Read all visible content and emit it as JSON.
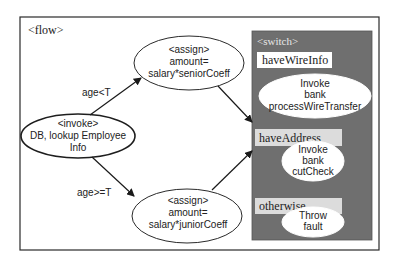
{
  "flow": {
    "label": "<flow>",
    "invoke_node": {
      "line1": "<invoke>",
      "line2": "DB, lookup Employee",
      "line3": "Info"
    },
    "senior_assign": {
      "line1": "<assign>",
      "line2": "amount=",
      "line3": "salary*seniorCoeff"
    },
    "junior_assign": {
      "line1": "<assign>",
      "line2": "amount=",
      "line3": "salary*juniorCoeff"
    },
    "edges": {
      "senior_condition": "age<T",
      "junior_condition": "age>=T"
    }
  },
  "switch": {
    "label": "<switch>",
    "cases": [
      {
        "condition": "haveWireInfo",
        "action": {
          "line1": "Invoke",
          "line2": "bank",
          "line3": "processWireTransfer"
        }
      },
      {
        "condition": "haveAddress",
        "action": {
          "line1": "Invoke",
          "line2": "bank",
          "line3": "cutCheck"
        }
      },
      {
        "condition": "otherwise",
        "action": {
          "line1": "Throw",
          "line2": "fault"
        }
      }
    ]
  },
  "colors": {
    "switch_background": "#6f6f6f",
    "condition_label_light": "#dcdcdc",
    "condition_label_white": "#ffffff",
    "stroke": "#2a2a2a"
  }
}
